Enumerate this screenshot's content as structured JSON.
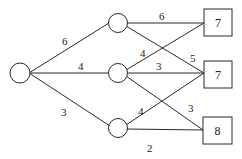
{
  "diagram": {
    "type": "network",
    "nodes": {
      "source": {
        "shape": "circle",
        "label": ""
      },
      "middle": [
        {
          "shape": "circle",
          "label": ""
        },
        {
          "shape": "circle",
          "label": ""
        },
        {
          "shape": "circle",
          "label": ""
        }
      ],
      "sinks": [
        {
          "shape": "box",
          "label": "7"
        },
        {
          "shape": "box",
          "label": "7"
        },
        {
          "shape": "box",
          "label": "8"
        }
      ]
    },
    "edges": [
      {
        "from": "source",
        "to": "middle-1",
        "weight": "6"
      },
      {
        "from": "source",
        "to": "middle-2",
        "weight": "4"
      },
      {
        "from": "source",
        "to": "middle-3",
        "weight": "3"
      },
      {
        "from": "middle-1",
        "to": "sink-1",
        "weight": "6"
      },
      {
        "from": "middle-1",
        "to": "sink-2",
        "weight": "5"
      },
      {
        "from": "middle-2",
        "to": "sink-1",
        "weight": "4"
      },
      {
        "from": "middle-2",
        "to": "sink-2",
        "weight": "3"
      },
      {
        "from": "middle-2",
        "to": "sink-3",
        "weight": "3"
      },
      {
        "from": "middle-3",
        "to": "sink-2",
        "weight": "4"
      },
      {
        "from": "middle-3",
        "to": "sink-3",
        "weight": "2"
      }
    ]
  }
}
